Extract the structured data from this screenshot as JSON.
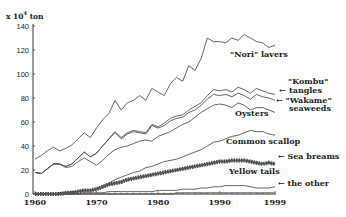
{
  "chart_data": {
    "type": "line",
    "title": "",
    "xlabel": "",
    "ylabel": "x 10^4 ton",
    "unit_text": "x 10",
    "unit_exp": "4",
    "unit_suffix": " ton",
    "xlim": [
      1959,
      2000
    ],
    "ylim": [
      0,
      140
    ],
    "x_ticks": [
      1960,
      1970,
      1980,
      1990,
      1999
    ],
    "x_tick_labels": [
      "1960",
      "1970",
      "1980",
      "1990",
      "1999"
    ],
    "y_ticks": [
      0,
      20,
      40,
      60,
      80,
      100,
      120,
      140
    ],
    "y_tick_labels": [
      "0",
      "20",
      "40",
      "60",
      "80",
      "100",
      "120",
      "140"
    ],
    "grid": false,
    "legend": "inline labels on right",
    "x": [
      1960,
      1961,
      1962,
      1963,
      1964,
      1965,
      1966,
      1967,
      1968,
      1969,
      1970,
      1971,
      1972,
      1973,
      1974,
      1975,
      1976,
      1977,
      1978,
      1979,
      1980,
      1981,
      1982,
      1983,
      1984,
      1985,
      1986,
      1987,
      1988,
      1989,
      1990,
      1991,
      1992,
      1993,
      1994,
      1995,
      1996,
      1997,
      1998,
      1999
    ],
    "series": [
      {
        "name": "\"Nori\" lavers",
        "values": [
          29,
          32,
          36,
          39,
          36,
          38,
          41,
          46,
          51,
          47,
          55,
          62,
          67,
          78,
          70,
          76,
          78,
          82,
          78,
          88,
          85,
          82,
          92,
          97,
          94,
          107,
          103,
          113,
          130,
          127,
          127,
          126,
          130,
          128,
          133,
          130,
          127,
          126,
          122,
          124
        ]
      },
      {
        "name": "\"Kombu\" tangles",
        "values": [
          18,
          17,
          21,
          25,
          25,
          23,
          25,
          30,
          35,
          31,
          34,
          40,
          46,
          52,
          47,
          51,
          53,
          52,
          51,
          58,
          56,
          59,
          63,
          65,
          66,
          70,
          73,
          76,
          82,
          87,
          86,
          87,
          85,
          89,
          87,
          84,
          88,
          86,
          84,
          83
        ]
      },
      {
        "name": "\"Wakame\" seaweeds",
        "values": [
          18,
          17,
          21,
          25,
          25,
          23,
          25,
          30,
          35,
          31,
          34,
          40,
          46,
          51,
          46,
          50,
          52,
          51,
          50,
          57,
          55,
          57,
          61,
          63,
          64,
          68,
          70,
          74,
          79,
          83,
          82,
          83,
          81,
          84,
          82,
          79,
          83,
          81,
          80,
          78
        ]
      },
      {
        "name": "Oysters",
        "values": [
          18,
          17,
          21,
          25,
          25,
          22,
          23,
          27,
          30,
          27,
          24,
          28,
          33,
          37,
          39,
          40,
          42,
          44,
          45,
          44,
          48,
          50,
          52,
          55,
          58,
          60,
          64,
          68,
          71,
          74,
          75,
          74,
          72,
          76,
          74,
          70,
          72,
          72,
          70,
          68
        ]
      },
      {
        "name": "Common scallop",
        "values": [
          0,
          0,
          0,
          0,
          1,
          1,
          2,
          2,
          3,
          3,
          4,
          6,
          9,
          12,
          14,
          16,
          18,
          19,
          22,
          23,
          25,
          27,
          28,
          29,
          31,
          33,
          35,
          37,
          40,
          43,
          44,
          46,
          48,
          49,
          51,
          53,
          52,
          52,
          50,
          49
        ]
      },
      {
        "name": "Sea breams",
        "values": [
          0,
          0,
          0,
          0,
          0,
          1,
          1,
          2,
          3,
          3,
          4,
          6,
          8,
          9,
          10,
          12,
          13,
          14,
          15,
          16,
          17,
          18,
          19,
          20,
          21,
          22,
          23,
          24,
          25,
          26,
          27,
          27,
          28,
          28,
          28,
          27,
          26,
          25,
          26,
          25
        ]
      },
      {
        "name": "Yellow tails",
        "values": [
          0,
          0,
          0,
          0,
          0,
          0,
          0,
          0,
          1,
          1,
          1,
          1,
          2,
          2,
          2,
          2,
          2,
          2,
          2,
          2,
          3,
          3,
          3,
          3,
          4,
          4,
          4,
          5,
          5,
          6,
          6,
          7,
          7,
          7,
          7,
          6,
          5,
          5,
          5,
          6
        ]
      },
      {
        "name": "the other",
        "values": [
          0,
          0,
          0,
          0,
          0,
          0,
          0,
          0,
          0,
          0,
          0,
          0,
          0,
          0,
          0,
          0,
          0,
          0,
          0,
          0,
          0,
          0,
          0,
          1,
          1,
          1,
          1,
          1,
          1,
          1,
          1,
          1,
          1,
          1,
          1,
          1,
          1,
          1,
          1,
          1
        ]
      }
    ],
    "annotations": [
      {
        "text": "\"Nori\" lavers",
        "x": 230,
        "y": 57
      },
      {
        "text": "\"Kombu\"",
        "x": 288,
        "y": 84
      },
      {
        "text": "tangles",
        "x": 289,
        "y": 93
      },
      {
        "text": "← \"Wakame\"",
        "x": 276,
        "y": 103
      },
      {
        "text": "seaweeds",
        "x": 289,
        "y": 111
      },
      {
        "text": "Oysters",
        "x": 235,
        "y": 116
      },
      {
        "text": "Common scallop",
        "x": 226,
        "y": 144
      },
      {
        "text": "← Sea breams",
        "x": 278,
        "y": 159
      },
      {
        "text": "Yellow tails",
        "x": 229,
        "y": 174
      },
      {
        "text": "← the other",
        "x": 278,
        "y": 186
      }
    ],
    "label_arrows": [
      {
        "for": "Kombu",
        "text": "←",
        "x": 279,
        "y": 93
      }
    ]
  }
}
